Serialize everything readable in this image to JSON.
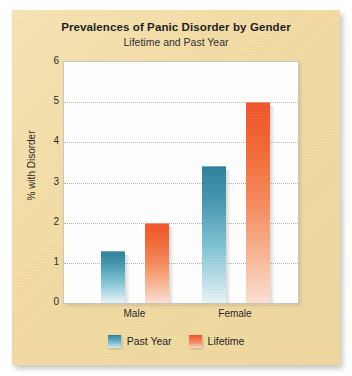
{
  "chart_data": {
    "type": "bar",
    "title": "Prevalences of Panic Disorder by Gender",
    "subtitle": "Lifetime and Past Year",
    "xlabel": "",
    "ylabel": "% with Disorder",
    "categories": [
      "Male",
      "Female"
    ],
    "series": [
      {
        "name": "Past Year",
        "color": "#2b7e9a",
        "values": [
          1.3,
          3.4
        ]
      },
      {
        "name": "Lifetime",
        "color": "#f0522a",
        "values": [
          2.0,
          5.0
        ]
      }
    ],
    "ylim": [
      0,
      6
    ],
    "yticks": [
      0,
      1,
      2,
      3,
      4,
      5,
      6
    ],
    "ytick_labels": [
      "0",
      "1",
      "2",
      "3",
      "4",
      "5",
      "6"
    ],
    "grid": true,
    "grid_style": "dotted",
    "legend_position": "bottom",
    "plot_background": "#ffffff",
    "card_background": "#f2dba2"
  },
  "legend": {
    "items": [
      {
        "label": "Past Year",
        "swatch": "teal"
      },
      {
        "label": "Lifetime",
        "swatch": "orange"
      }
    ]
  }
}
